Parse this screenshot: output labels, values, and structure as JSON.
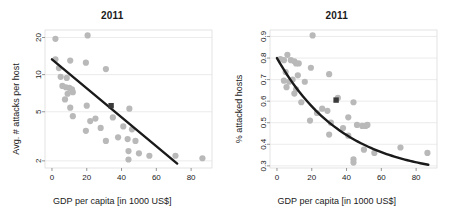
{
  "figure": {
    "panel_count": 2,
    "background_color": "#ffffff",
    "point_color": "#b9b9b9",
    "highlight_color": "#3a3a3a",
    "fit_line_color": "#1a1a1a",
    "grid_color": "#e2e2e2",
    "frame_color": "#d8d8d8"
  },
  "chart_data": [
    {
      "id": "left-panel",
      "type": "scatter",
      "title": "2011",
      "xlabel": "GDP per capita [in 1000 US$]",
      "ylabel": "Avg. # attacks per host",
      "xlim": [
        -4,
        92
      ],
      "ylim_log": [
        1.75,
        23
      ],
      "yscale": "log",
      "xscale": "linear",
      "grid": true,
      "grid_axis": "y",
      "legend": "none",
      "xticks": [
        0,
        20,
        40,
        60,
        80
      ],
      "xtick_labels": [
        "0",
        "20",
        "40",
        "60",
        "80"
      ],
      "yticks": [
        2,
        5,
        10,
        20
      ],
      "ytick_labels": [
        "2",
        "5",
        "10",
        "20"
      ],
      "points": [
        {
          "x": 2,
          "y": 19.5
        },
        {
          "x": 20.5,
          "y": 20.8
        },
        {
          "x": 2,
          "y": 13.3
        },
        {
          "x": 10.5,
          "y": 13.0
        },
        {
          "x": 19.5,
          "y": 12.5
        },
        {
          "x": 31,
          "y": 11.1
        },
        {
          "x": 4,
          "y": 11.3
        },
        {
          "x": 5,
          "y": 9.6
        },
        {
          "x": 8.5,
          "y": 9.4
        },
        {
          "x": 6,
          "y": 8.1
        },
        {
          "x": 8,
          "y": 7.9
        },
        {
          "x": 10,
          "y": 7.8
        },
        {
          "x": 11.5,
          "y": 7.6
        },
        {
          "x": 9,
          "y": 7.0
        },
        {
          "x": 12,
          "y": 7.2
        },
        {
          "x": 7.5,
          "y": 6.3
        },
        {
          "x": 10.5,
          "y": 5.4
        },
        {
          "x": 20,
          "y": 5.6
        },
        {
          "x": 44.5,
          "y": 5.3
        },
        {
          "x": 12,
          "y": 4.6
        },
        {
          "x": 22,
          "y": 4.2
        },
        {
          "x": 25,
          "y": 4.4
        },
        {
          "x": 35,
          "y": 4.5
        },
        {
          "x": 19.5,
          "y": 3.5
        },
        {
          "x": 28,
          "y": 3.7
        },
        {
          "x": 41,
          "y": 3.8
        },
        {
          "x": 46,
          "y": 3.6
        },
        {
          "x": 31,
          "y": 2.9
        },
        {
          "x": 38,
          "y": 3.1
        },
        {
          "x": 43.5,
          "y": 3.0
        },
        {
          "x": 48,
          "y": 2.9
        },
        {
          "x": 44,
          "y": 2.4
        },
        {
          "x": 50,
          "y": 2.3
        },
        {
          "x": 56,
          "y": 2.2
        },
        {
          "x": 71,
          "y": 2.2
        },
        {
          "x": 86.5,
          "y": 2.1
        },
        {
          "x": 44,
          "y": 2.05
        }
      ],
      "highlight_point": {
        "x": 34,
        "y": 5.6,
        "label": "highlighted-country-marker"
      },
      "fit_line": {
        "x_start": 0,
        "y_start": 13.3,
        "x_end": 72,
        "y_end": 1.9,
        "kind": "log-linear"
      }
    },
    {
      "id": "right-panel",
      "type": "scatter",
      "title": "2011",
      "xlabel": "GDP per capita [in 1000 US$]",
      "ylabel": "% attacked hosts",
      "xlim": [
        -4,
        92
      ],
      "ylim": [
        0.29,
        0.93
      ],
      "yscale": "linear",
      "xscale": "linear",
      "grid": true,
      "grid_axis": "y",
      "legend": "none",
      "xticks": [
        0,
        20,
        40,
        60,
        80
      ],
      "xtick_labels": [
        "0",
        "20",
        "40",
        "60",
        "80"
      ],
      "yticks": [
        0.3,
        0.4,
        0.5,
        0.6,
        0.7,
        0.8,
        0.9
      ],
      "ytick_labels": [
        "0.3",
        "0.4",
        "0.5",
        "0.6",
        "0.7",
        "0.8",
        "0.9"
      ],
      "points": [
        {
          "x": 20.5,
          "y": 0.905
        },
        {
          "x": 6,
          "y": 0.815
        },
        {
          "x": 2,
          "y": 0.795
        },
        {
          "x": 4,
          "y": 0.79
        },
        {
          "x": 8,
          "y": 0.79
        },
        {
          "x": 10,
          "y": 0.785
        },
        {
          "x": 11,
          "y": 0.775
        },
        {
          "x": 12.5,
          "y": 0.775
        },
        {
          "x": 19.5,
          "y": 0.755
        },
        {
          "x": 5,
          "y": 0.735
        },
        {
          "x": 12,
          "y": 0.72
        },
        {
          "x": 30,
          "y": 0.725
        },
        {
          "x": 4,
          "y": 0.695
        },
        {
          "x": 7,
          "y": 0.69
        },
        {
          "x": 9,
          "y": 0.7
        },
        {
          "x": 16,
          "y": 0.69
        },
        {
          "x": 5.5,
          "y": 0.665
        },
        {
          "x": 11,
          "y": 0.655
        },
        {
          "x": 10,
          "y": 0.635
        },
        {
          "x": 35,
          "y": 0.615
        },
        {
          "x": 14,
          "y": 0.595
        },
        {
          "x": 44,
          "y": 0.595
        },
        {
          "x": 26,
          "y": 0.565
        },
        {
          "x": 29,
          "y": 0.555
        },
        {
          "x": 23,
          "y": 0.545
        },
        {
          "x": 41,
          "y": 0.525
        },
        {
          "x": 19,
          "y": 0.51
        },
        {
          "x": 31,
          "y": 0.5
        },
        {
          "x": 46,
          "y": 0.49
        },
        {
          "x": 49,
          "y": 0.485
        },
        {
          "x": 51,
          "y": 0.485
        },
        {
          "x": 52,
          "y": 0.49
        },
        {
          "x": 38,
          "y": 0.475
        },
        {
          "x": 30,
          "y": 0.445
        },
        {
          "x": 41,
          "y": 0.44
        },
        {
          "x": 71,
          "y": 0.385
        },
        {
          "x": 50,
          "y": 0.375
        },
        {
          "x": 56,
          "y": 0.36
        },
        {
          "x": 86.5,
          "y": 0.36
        },
        {
          "x": 44,
          "y": 0.33
        },
        {
          "x": 44,
          "y": 0.315
        }
      ],
      "highlight_point": {
        "x": 34,
        "y": 0.605,
        "label": "highlighted-country-marker"
      },
      "fit_line": {
        "kind": "convex-decreasing",
        "x_start": 0,
        "y_start": 0.8,
        "x_end": 87,
        "y_end": 0.305
      }
    }
  ]
}
